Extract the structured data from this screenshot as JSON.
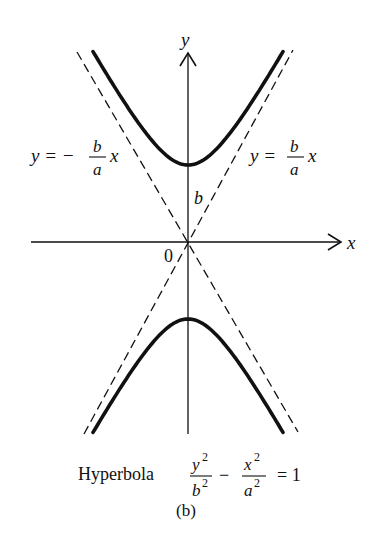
{
  "figure": {
    "caption": "(b)",
    "title_word": "Hyperbola",
    "equation": {
      "term1_num": "y",
      "term1_den": "b",
      "term2_num": "x",
      "term2_den": "a",
      "exponent": "2",
      "minus": "−",
      "equals": "= 1"
    },
    "axes": {
      "x_label": "x",
      "y_label": "y",
      "origin_label": "0"
    },
    "labels": {
      "vertex_distance": "b",
      "asymptote_left": {
        "lhs": "y = −",
        "num": "b",
        "den": "a",
        "var": "x"
      },
      "asymptote_right": {
        "lhs": "y =",
        "num": "b",
        "den": "a",
        "var": "x"
      }
    },
    "geometry": {
      "origin": [
        188,
        242
      ],
      "a_px": 42,
      "b_px": 77,
      "curve_half_width_px": 95
    },
    "colors": {
      "ink": "#111111",
      "background": "#ffffff"
    }
  }
}
